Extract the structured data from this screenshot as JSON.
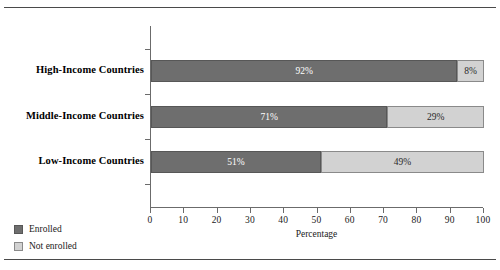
{
  "chart_data": {
    "type": "bar",
    "orientation": "horizontal",
    "stacked": true,
    "stack_total": 100,
    "title": "",
    "subtitle": "",
    "xlabel": "Percentage",
    "ylabel": "",
    "xlim": [
      0,
      100
    ],
    "xticks": [
      0,
      10,
      20,
      30,
      40,
      50,
      60,
      70,
      80,
      90,
      100
    ],
    "xtick_labels": [
      "0",
      "10",
      "20",
      "30",
      "40",
      "50",
      "60",
      "70",
      "80",
      "90",
      "100"
    ],
    "grid": false,
    "legend_position": "bottom-left",
    "categories": [
      "High-Income Countries",
      "Middle-Income Countries",
      "Low-Income Countries"
    ],
    "series": [
      {
        "name": "Enrolled",
        "color": "#6e6e6e",
        "values": [
          92,
          71,
          51
        ],
        "labels": [
          "92%",
          "71%",
          "51%"
        ]
      },
      {
        "name": "Not enrolled",
        "color": "#d2d2d2",
        "values": [
          8,
          29,
          49
        ],
        "labels": [
          "8%",
          "29%",
          "49%"
        ]
      }
    ],
    "bars": [
      {
        "category": "High-Income Countries",
        "segments": [
          {
            "series": "Enrolled",
            "value": 92,
            "label": "92%"
          },
          {
            "series": "Not enrolled",
            "value": 8,
            "label": "8%"
          }
        ]
      },
      {
        "category": "Middle-Income Countries",
        "segments": [
          {
            "series": "Enrolled",
            "value": 71,
            "label": "71%"
          },
          {
            "series": "Not enrolled",
            "value": 29,
            "label": "29%"
          }
        ]
      },
      {
        "category": "Low-Income Countries",
        "segments": [
          {
            "series": "Enrolled",
            "value": 51,
            "label": "51%"
          },
          {
            "series": "Not enrolled",
            "value": 49,
            "label": "49%"
          }
        ]
      }
    ]
  },
  "legend": {
    "items": [
      {
        "label": "Enrolled",
        "color": "#6e6e6e"
      },
      {
        "label": "Not enrolled",
        "color": "#d2d2d2"
      }
    ]
  },
  "axis": {
    "x_title": "Percentage"
  },
  "colors": {
    "enrolled": "#6e6e6e",
    "not_enrolled": "#d2d2d2",
    "axis": "#6b6b6b",
    "rule": "#4a4a4a",
    "text": "#1a1a1a"
  }
}
